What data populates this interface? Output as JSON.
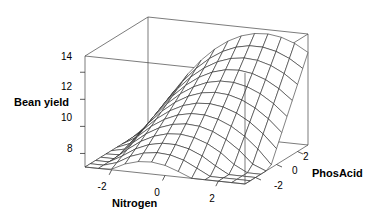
{
  "chart_data": {
    "type": "surface",
    "title": "",
    "xlabel": "Nitrogen",
    "ylabel": "PhosAcid",
    "zlabel": "Bean yield",
    "x_ticks": [
      "-2",
      "0",
      "2"
    ],
    "x_tick_values": [
      -2,
      0,
      2
    ],
    "y_ticks": [
      "2",
      "0",
      "-2"
    ],
    "y_tick_values": [
      2,
      0,
      -2
    ],
    "z_ticks": [
      "14",
      "12",
      "10",
      "8"
    ],
    "z_tick_values": [
      14,
      12,
      10,
      8
    ],
    "xlim": [
      -3,
      3
    ],
    "ylim": [
      -3,
      3
    ],
    "zlim": [
      7,
      15.2
    ],
    "grid": false,
    "legend": "none",
    "surface_model": "quadratic response surface (saddle / rising ridge)",
    "model_coefficients": {
      "intercept": 10.9,
      "nitrogen": 0.35,
      "phosacid": 1.05,
      "nitrogen_sq": -0.42,
      "phosacid_sq": 0.0,
      "nitrogen_phosacid": 0.28
    },
    "mesh_n": 13,
    "z_range_observed": [
      7.6,
      15.1
    ],
    "colors": {
      "mesh": "#1a1a1a",
      "box": "#444444",
      "background": "#ffffff",
      "text": "#000000"
    }
  },
  "axes": {
    "z": {
      "label": "Bean yield",
      "ticks": [
        {
          "text": "14"
        },
        {
          "text": "12"
        },
        {
          "text": "10"
        },
        {
          "text": "8"
        }
      ]
    },
    "x": {
      "label": "Nitrogen",
      "ticks": [
        {
          "text": "-2"
        },
        {
          "text": "0"
        },
        {
          "text": "2"
        }
      ]
    },
    "y": {
      "label": "PhosAcid",
      "ticks": [
        {
          "text": "2"
        },
        {
          "text": "0"
        },
        {
          "text": "-2"
        }
      ]
    }
  }
}
